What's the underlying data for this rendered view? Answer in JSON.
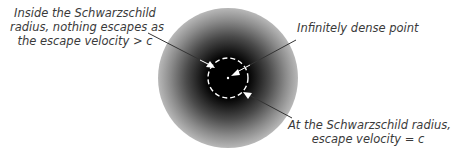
{
  "diagram": {
    "type": "black-hole-schwarzschild-radius",
    "colors": {
      "background": "#ffffff",
      "core": "#000000",
      "dashed_circle": "#ffffff",
      "arrow": "#ffffff",
      "leader_line": "#333333",
      "text": "#3a3a3a"
    },
    "labels": {
      "inside": {
        "line1": "Inside the Schwarzschild",
        "line2": "radius, nothing escapes as",
        "line3": "the escape velocity > c"
      },
      "point": {
        "line1": "Infinitely dense point"
      },
      "radius": {
        "line1": "At the Schwarzschild radius,",
        "line2": "escape velocity = c"
      }
    }
  }
}
